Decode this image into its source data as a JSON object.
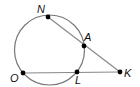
{
  "diagram": {
    "type": "circle-secant-geometry",
    "circle": {
      "cx": 49.5,
      "cy": 50,
      "r": 35,
      "stroke": "#777777"
    },
    "points": [
      {
        "id": "N",
        "label": "N",
        "x": 48,
        "y": 17,
        "lx": 37,
        "ly": 13
      },
      {
        "id": "A",
        "label": "A",
        "x": 84,
        "y": 46,
        "lx": 84,
        "ly": 41
      },
      {
        "id": "O",
        "label": "O",
        "x": 23,
        "y": 73,
        "lx": 10,
        "ly": 82
      },
      {
        "id": "L",
        "label": "L",
        "x": 77,
        "y": 72,
        "lx": 75,
        "ly": 84
      },
      {
        "id": "K",
        "label": "K",
        "x": 120,
        "y": 72,
        "lx": 124,
        "ly": 77
      }
    ],
    "segments": [
      {
        "from": "N",
        "to": "K"
      },
      {
        "from": "O",
        "to": "K"
      }
    ],
    "line_color": "#888888",
    "point_color": "#000000"
  }
}
